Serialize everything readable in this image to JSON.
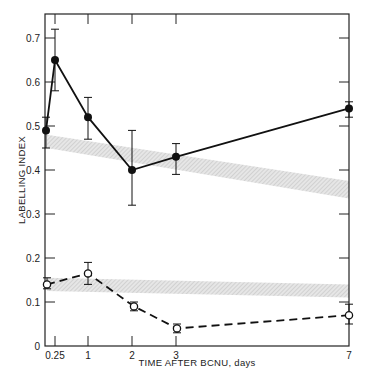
{
  "chart_data": {
    "type": "line",
    "title": "",
    "xlabel": "TIME AFTER BCNU, days",
    "ylabel": "LABELLING INDEX",
    "ylim": [
      0,
      0.75
    ],
    "grid": false,
    "legend": null,
    "x_ticks": [
      {
        "value": 0.25,
        "label": "0.25",
        "px": 55
      },
      {
        "value": 1,
        "label": "1",
        "px": 88
      },
      {
        "value": 2,
        "label": "2",
        "px": 132
      },
      {
        "value": 3,
        "label": "3",
        "px": 176
      },
      {
        "value": 7,
        "label": "7",
        "px": 349
      }
    ],
    "y_ticks": [
      {
        "value": 0,
        "label": "0"
      },
      {
        "value": 0.1,
        "label": "0.1"
      },
      {
        "value": 0.2,
        "label": "0.2"
      },
      {
        "value": 0.3,
        "label": "0.3"
      },
      {
        "value": 0.4,
        "label": "0.4"
      },
      {
        "value": 0.5,
        "label": "0.5"
      },
      {
        "value": 0.6,
        "label": "0.6"
      },
      {
        "value": 0.7,
        "label": "0.7"
      }
    ],
    "series": [
      {
        "name": "filled circles (solid line)",
        "marker": "filled-circle",
        "line": "solid",
        "points": [
          {
            "x": 0,
            "px": 46,
            "y": 0.49,
            "err_low": 0.45,
            "err_high": 0.52
          },
          {
            "x": 0.25,
            "px": 55,
            "y": 0.65,
            "err_low": 0.58,
            "err_high": 0.72
          },
          {
            "x": 1,
            "px": 88,
            "y": 0.52,
            "err_low": 0.47,
            "err_high": 0.565
          },
          {
            "x": 2,
            "px": 132,
            "y": 0.4,
            "err_low": 0.32,
            "err_high": 0.49
          },
          {
            "x": 3,
            "px": 176,
            "y": 0.43,
            "err_low": 0.39,
            "err_high": 0.46
          },
          {
            "x": 7,
            "px": 349,
            "y": 0.54,
            "err_low": 0.52,
            "err_high": 0.555
          }
        ]
      },
      {
        "name": "open circles (dashed line)",
        "marker": "open-circle",
        "line": "dashed",
        "points": [
          {
            "x": 0,
            "px": 47,
            "y": 0.14,
            "err_low": 0.13,
            "err_high": 0.155
          },
          {
            "x": 1,
            "px": 88,
            "y": 0.165,
            "err_low": 0.14,
            "err_high": 0.19
          },
          {
            "x": 2,
            "px": 134,
            "y": 0.09,
            "err_low": 0.08,
            "err_high": 0.1
          },
          {
            "x": 3,
            "px": 177,
            "y": 0.04,
            "err_low": 0.03,
            "err_high": 0.05
          },
          {
            "x": 7,
            "px": 349,
            "y": 0.07,
            "err_low": 0.05,
            "err_high": 0.095
          }
        ]
      }
    ],
    "bands": [
      {
        "name": "upper control band",
        "left": [
          0.45,
          0.48
        ],
        "right": [
          0.335,
          0.375
        ]
      },
      {
        "name": "lower control band",
        "left": [
          0.125,
          0.155
        ],
        "right": [
          0.11,
          0.14
        ]
      }
    ]
  },
  "labels": {
    "xlabel": "TIME AFTER BCNU, days",
    "ylabel": "LABELLING INDEX"
  }
}
